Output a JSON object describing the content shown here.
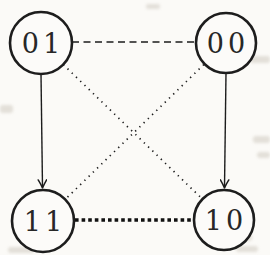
{
  "diagram": {
    "type": "graph",
    "nodes": [
      {
        "id": "01",
        "label": "01",
        "position": "top-left"
      },
      {
        "id": "00",
        "label": "00",
        "position": "top-right"
      },
      {
        "id": "11",
        "label": "11",
        "position": "bottom-left"
      },
      {
        "id": "10",
        "label": "10",
        "position": "bottom-right"
      }
    ],
    "edges": [
      {
        "from": "01",
        "to": "00",
        "style": "dashed",
        "directed": false
      },
      {
        "from": "01",
        "to": "11",
        "style": "solid-arrow",
        "directed": true
      },
      {
        "from": "00",
        "to": "10",
        "style": "solid-arrow",
        "directed": true
      },
      {
        "from": "11",
        "to": "10",
        "style": "bold-dotted",
        "directed": false
      },
      {
        "from": "01",
        "to": "10",
        "style": "fine-dotted",
        "directed": false
      },
      {
        "from": "00",
        "to": "11",
        "style": "fine-dotted",
        "directed": false
      }
    ],
    "colors": {
      "line": "#1d1d1d",
      "label": "#272727",
      "background": "#fbfaf7"
    }
  }
}
